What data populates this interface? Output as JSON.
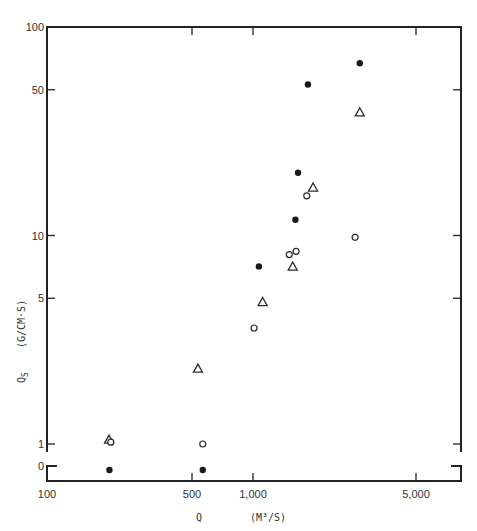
{
  "chart_data": {
    "type": "scatter",
    "title": "",
    "xlabel": "Q (M3/S)",
    "ylabel": "QS (G/CM·S)",
    "x_scale": "log",
    "y_scale": "log",
    "xlim": [
      100,
      7000
    ],
    "ylim": [
      1,
      100
    ],
    "y_break_value": 0,
    "grid": false,
    "legend": null,
    "x_ticks": [
      {
        "value": 100,
        "label": "100"
      },
      {
        "value": 500,
        "label": "500"
      },
      {
        "value": 1000,
        "label": "1,000"
      },
      {
        "value": 5000,
        "label": "5,000"
      }
    ],
    "y_ticks": [
      {
        "value": 100,
        "label": "100"
      },
      {
        "value": 50,
        "label": "50"
      },
      {
        "value": 10,
        "label": "10"
      },
      {
        "value": 5,
        "label": "5"
      },
      {
        "value": 1,
        "label": "1"
      },
      {
        "value": 0,
        "label": "0"
      }
    ],
    "series": [
      {
        "name": "filled-circle",
        "marker": "filled-circle",
        "points": [
          {
            "x": 2870,
            "y": 67
          },
          {
            "x": 1720,
            "y": 53
          },
          {
            "x": 1560,
            "y": 20
          },
          {
            "x": 1520,
            "y": 11.9
          },
          {
            "x": 1060,
            "y": 7.1
          },
          {
            "x": 200,
            "y": 0
          },
          {
            "x": 565,
            "y": 0
          }
        ]
      },
      {
        "name": "open-triangle",
        "marker": "open-triangle",
        "points": [
          {
            "x": 2870,
            "y": 39
          },
          {
            "x": 1810,
            "y": 17
          },
          {
            "x": 1480,
            "y": 7.1
          },
          {
            "x": 1100,
            "y": 4.8
          },
          {
            "x": 535,
            "y": 2.3
          },
          {
            "x": 199,
            "y": 1.05
          }
        ]
      },
      {
        "name": "open-circle",
        "marker": "open-circle",
        "points": [
          {
            "x": 1700,
            "y": 15.5
          },
          {
            "x": 2740,
            "y": 9.8
          },
          {
            "x": 1530,
            "y": 8.4
          },
          {
            "x": 1430,
            "y": 8.1
          },
          {
            "x": 1010,
            "y": 3.6
          },
          {
            "x": 203,
            "y": 1.02
          },
          {
            "x": 565,
            "y": 1.0
          }
        ]
      }
    ]
  },
  "axes": {
    "x_title_symbol": "Q",
    "x_title_units": "(M³/S)",
    "y_title_symbol": "Q",
    "y_title_subscript": "S",
    "y_title_units": "(G/CM·S)"
  }
}
